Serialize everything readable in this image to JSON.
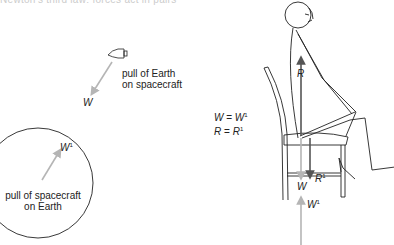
{
  "top_cut_text": "Newton's third law: forces act in pairs",
  "spacecraft_panel": {
    "label_line1": "pull of Earth",
    "label_line2": "on spacecraft",
    "force_label": "W"
  },
  "earth_panel": {
    "label_line1": "pull of spacecraft",
    "label_line2": "on Earth",
    "force_label": "W",
    "force_sup": "1"
  },
  "equations": {
    "eq1_lhs": "W",
    "eq1_eq": " = ",
    "eq1_rhs": "W",
    "eq1_sup": "1",
    "eq2_lhs": "R",
    "eq2_eq": " = ",
    "eq2_rhs": "R",
    "eq2_sup": "1"
  },
  "chair_panel": {
    "reaction_label": "R",
    "reaction_pair_label": "R",
    "reaction_pair_sup": "1",
    "weight_label": "W",
    "weight_pair_label": "W",
    "weight_pair_sup": "1"
  },
  "colors": {
    "line": "#222222",
    "arrow_dark": "#555555",
    "arrow_light": "#b5b5b5"
  }
}
